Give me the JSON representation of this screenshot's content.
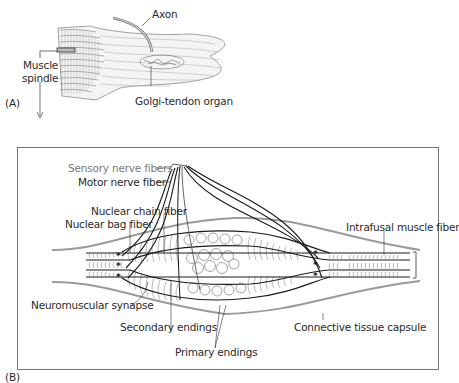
{
  "panel_a": {
    "tag": "(A)",
    "labels": {
      "axon": "Axon",
      "muscle_spindle_line1": "Muscle",
      "muscle_spindle_line2": "spindle",
      "golgi": "Golgi-tendon organ"
    }
  },
  "panel_b": {
    "tag": "(B)",
    "labels": {
      "sensory": "Sensory nerve fibers",
      "motor": "Motor nerve fiber",
      "nuclear_chain": "Nuclear chain fiber",
      "nuclear_bag": "Nuclear bag fiber",
      "intrafusal": "Intrafusal muscle fiber",
      "neuromuscular": "Neuromuscular synapse",
      "secondary": "Secondary endings",
      "connective": "Connective tissue capsule",
      "primary": "Primary endings"
    }
  },
  "colors": {
    "line": "#1a1a1a",
    "capsule": "#9a9a9a",
    "striation": "#8c8c8c",
    "sensory_text": "#7a7a7a",
    "frame": "#555555"
  }
}
